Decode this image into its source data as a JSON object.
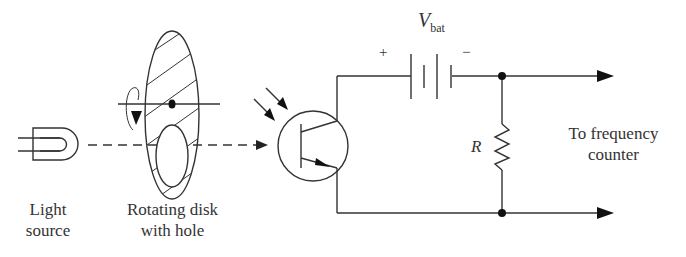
{
  "labels": {
    "light_source": [
      "Light",
      "source"
    ],
    "disk": [
      "Rotating disk",
      "with hole"
    ],
    "battery_symbol": "V",
    "battery_subscript": "bat",
    "battery_plus": "+",
    "battery_minus": "−",
    "resistor": "R",
    "output": [
      "To frequency",
      "counter"
    ]
  },
  "colors": {
    "ink": "#333333",
    "background": "#ffffff"
  }
}
